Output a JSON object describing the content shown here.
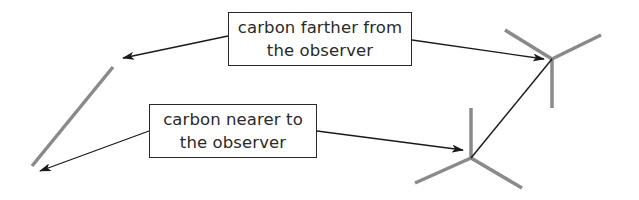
{
  "labels": {
    "far_carbon": {
      "line1": "carbon farther from",
      "line2": "the observer"
    },
    "near_carbon": {
      "line1": "carbon nearer to",
      "line2": "the observer"
    }
  },
  "colors": {
    "bond_gray": "#8a8a8a",
    "arrow_black": "#1a1a1a",
    "box_border": "#2a2a2a"
  },
  "diagram": {
    "elements": [
      "edge-on carbon-carbon line (gray)",
      "sawhorse back carbon with three gray bonds",
      "sawhorse front carbon with three gray bonds",
      "black C-C bond connecting sawhorse carbons",
      "four arrows pointing from labels to carbons"
    ]
  }
}
